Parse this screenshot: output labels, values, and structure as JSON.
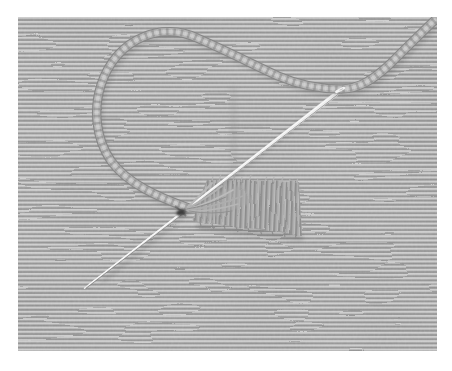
{
  "meta": {
    "description": "Black-and-white close-up photograph of hand embroidery in progress: a steel needle threaded with loosely twisted floss forms a loop above a rectangular block of satin stitch worked on horizontally ribbed woven fabric; the needle points to the lower left and the thread tail exits the top right corner."
  },
  "scene": {
    "frame": {
      "background": "#ffffff"
    },
    "fabric": {
      "label": "ribbed woven fabric",
      "rib_light": "#cbcbcb",
      "rib_dark": "#8e8e8e"
    },
    "thread": {
      "label": "twisted embroidery floss loop",
      "color": "#b3b3b3",
      "edge_color": "#858585",
      "highlight": "#cdcdcd"
    },
    "needle": {
      "label": "embroidery needle",
      "color": "#eeeeee",
      "edge_color": "#6f6f6f"
    },
    "patch": {
      "label": "satin stitch block",
      "color": "#9d9d9d"
    },
    "hole": {
      "label": "stitch entry hole",
      "color": "#3e3e3e"
    }
  }
}
